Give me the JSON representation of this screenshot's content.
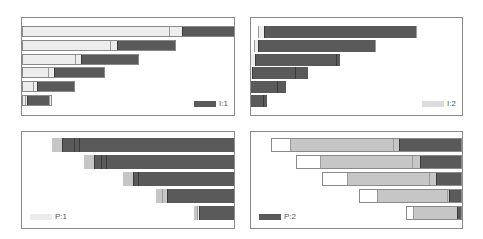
{
  "colors": {
    "dark": "#5a5a5a",
    "mid": "#c6c6c6",
    "light": "#ededed",
    "white": "#ffffff",
    "divider": "#3a3a3a",
    "outline": "#8a8a8a"
  },
  "legends": {
    "p1": {
      "label": "I:1",
      "color": "#5a5a5a"
    },
    "p2": {
      "label": "I:2",
      "color": "#dcdcdc"
    },
    "p3": {
      "label": "P:1",
      "color": "#ececec"
    },
    "p4": {
      "label": "P:2",
      "color": "#5a5a5a"
    }
  },
  "chart_data": [
    {
      "type": "bar",
      "orientation": "horizontal-stacked",
      "title": "",
      "legend": [
        "I:1"
      ],
      "legend_position": "bottom-right",
      "grid": false,
      "rows": [
        {
          "segments": [
            {
              "c": "light",
              "w": 0
            },
            {
              "c": "light",
              "w": 147
            },
            {
              "c": "light",
              "w": 13
            },
            {
              "c": "dark",
              "w": 52
            },
            {
              "c": "dark",
              "w": 6
            }
          ]
        },
        {
          "segments": [
            {
              "c": "light",
              "w": 0
            },
            {
              "c": "light",
              "w": 88
            },
            {
              "c": "light",
              "w": 7
            },
            {
              "c": "dark",
              "w": 59
            }
          ]
        },
        {
          "segments": [
            {
              "c": "light",
              "w": 0
            },
            {
              "c": "light",
              "w": 53
            },
            {
              "c": "light",
              "w": 6
            },
            {
              "c": "dark",
              "w": 58
            }
          ]
        },
        {
          "segments": [
            {
              "c": "light",
              "w": 0
            },
            {
              "c": "light",
              "w": 26
            },
            {
              "c": "light",
              "w": 6
            },
            {
              "c": "dark",
              "w": 51
            }
          ]
        },
        {
          "segments": [
            {
              "c": "light",
              "w": 0
            },
            {
              "c": "light",
              "w": 11
            },
            {
              "c": "light",
              "w": 4
            },
            {
              "c": "dark",
              "w": 38
            }
          ]
        },
        {
          "segments": [
            {
              "c": "light",
              "w": 0
            },
            {
              "c": "light",
              "w": 3
            },
            {
              "c": "light",
              "w": 2
            },
            {
              "c": "dark",
              "w": 22
            },
            {
              "c": "light",
              "w": 3
            }
          ]
        }
      ]
    },
    {
      "type": "bar",
      "orientation": "horizontal-stacked",
      "title": "",
      "legend": [
        "I:2"
      ],
      "legend_position": "bottom-right",
      "grid": false,
      "rows": [
        {
          "segments": [
            {
              "c": "white",
              "w": 7
            },
            {
              "c": "light",
              "w": 6
            },
            {
              "c": "dark",
              "w": 152
            },
            {
              "c": "white",
              "w": 12
            }
          ]
        },
        {
          "segments": [
            {
              "c": "white",
              "w": 3
            },
            {
              "c": "light",
              "w": 4
            },
            {
              "c": "dark",
              "w": 117
            },
            {
              "c": "white",
              "w": 4
            }
          ]
        },
        {
          "segments": [
            {
              "c": "light",
              "w": 4
            },
            {
              "c": "dark",
              "w": 81
            },
            {
              "c": "dark",
              "w": 4
            }
          ]
        },
        {
          "segments": [
            {
              "c": "light",
              "w": 1
            },
            {
              "c": "dark",
              "w": 43
            },
            {
              "c": "dark",
              "w": 13
            }
          ]
        },
        {
          "segments": [
            {
              "c": "dark",
              "w": 26
            },
            {
              "c": "dark",
              "w": 9
            }
          ]
        },
        {
          "segments": [
            {
              "c": "dark",
              "w": 12
            },
            {
              "c": "dark",
              "w": 4
            }
          ]
        }
      ]
    },
    {
      "type": "bar",
      "orientation": "horizontal-stacked",
      "title": "",
      "legend": [
        "P:1"
      ],
      "legend_position": "bottom-left",
      "grid": false,
      "rows": [
        {
          "start": 30,
          "segments": [
            {
              "c": "mid",
              "w": 10
            },
            {
              "c": "dark",
              "w": 12
            },
            {
              "c": "dark",
              "w": 5
            },
            {
              "c": "dark",
              "w": 156
            }
          ]
        },
        {
          "start": 62,
          "segments": [
            {
              "c": "mid",
              "w": 10
            },
            {
              "c": "dark",
              "w": 7
            },
            {
              "c": "dark",
              "w": 5
            },
            {
              "c": "dark",
              "w": 130
            }
          ]
        },
        {
          "start": 101,
          "segments": [
            {
              "c": "mid",
              "w": 10
            },
            {
              "c": "dark",
              "w": 5
            },
            {
              "c": "dark",
              "w": 98
            }
          ]
        },
        {
          "start": 134,
          "segments": [
            {
              "c": "mid",
              "w": 6
            },
            {
              "c": "mid",
              "w": 5
            },
            {
              "c": "dark",
              "w": 69
            }
          ]
        },
        {
          "start": 172,
          "segments": [
            {
              "c": "mid",
              "w": 3
            },
            {
              "c": "light",
              "w": 2
            },
            {
              "c": "dark",
              "w": 37
            }
          ]
        }
      ]
    },
    {
      "type": "bar",
      "orientation": "horizontal-stacked",
      "title": "",
      "legend": [
        "P:2"
      ],
      "legend_position": "bottom-left",
      "grid": false,
      "rows": [
        {
          "start": 20,
          "segments": [
            {
              "c": "white",
              "w": 19
            },
            {
              "c": "mid",
              "w": 103
            },
            {
              "c": "mid",
              "w": 6
            },
            {
              "c": "dark",
              "w": 63
            }
          ]
        },
        {
          "start": 45,
          "segments": [
            {
              "c": "white",
              "w": 24
            },
            {
              "c": "mid",
              "w": 92
            },
            {
              "c": "mid",
              "w": 8
            },
            {
              "c": "dark",
              "w": 42
            }
          ]
        },
        {
          "start": 71,
          "segments": [
            {
              "c": "white",
              "w": 25
            },
            {
              "c": "mid",
              "w": 82
            },
            {
              "c": "mid",
              "w": 7
            },
            {
              "c": "dark",
              "w": 26
            }
          ]
        },
        {
          "start": 108,
          "segments": [
            {
              "c": "white",
              "w": 18
            },
            {
              "c": "mid",
              "w": 70
            },
            {
              "c": "mid",
              "w": 2
            },
            {
              "c": "dark",
              "w": 13
            }
          ]
        },
        {
          "start": 155,
          "segments": [
            {
              "c": "white",
              "w": 7
            },
            {
              "c": "mid",
              "w": 44
            },
            {
              "c": "dark",
              "w": 5
            }
          ]
        }
      ]
    }
  ]
}
